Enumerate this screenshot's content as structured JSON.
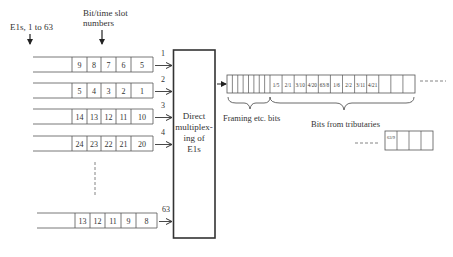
{
  "labels": {
    "e1s": "E1s, 1 to 63",
    "slot_numbers_line1": "Bit/time slot",
    "slot_numbers_line2": "numbers",
    "mux_line1": "Direct",
    "mux_line2": "multiplex-",
    "mux_line3": "ing of",
    "mux_line4": "E1s",
    "framing": "Framing etc. bits",
    "tributaries": "Bits from tributaries"
  },
  "inputs": [
    {
      "id": "1",
      "slots": [
        "9",
        "8",
        "7",
        "6",
        "5"
      ]
    },
    {
      "id": "2",
      "slots": [
        "5",
        "4",
        "3",
        "2",
        "1"
      ]
    },
    {
      "id": "3",
      "slots": [
        "14",
        "13",
        "12",
        "11",
        "10"
      ]
    },
    {
      "id": "4",
      "slots": [
        "24",
        "23",
        "22",
        "21",
        "20"
      ]
    },
    {
      "id": "63",
      "slots": [
        "13",
        "12",
        "11",
        "9",
        "8"
      ]
    }
  ],
  "output_frame": {
    "framing_cell_count": 8,
    "tributary_cells": [
      "1/5",
      "2/1",
      "3/10",
      "4/20",
      "63/8",
      "1/6",
      "2/2",
      "3/11",
      "4/21",
      "",
      "",
      ""
    ]
  },
  "continuation_frame": {
    "cells": [
      "63/9",
      "",
      "",
      ""
    ]
  }
}
